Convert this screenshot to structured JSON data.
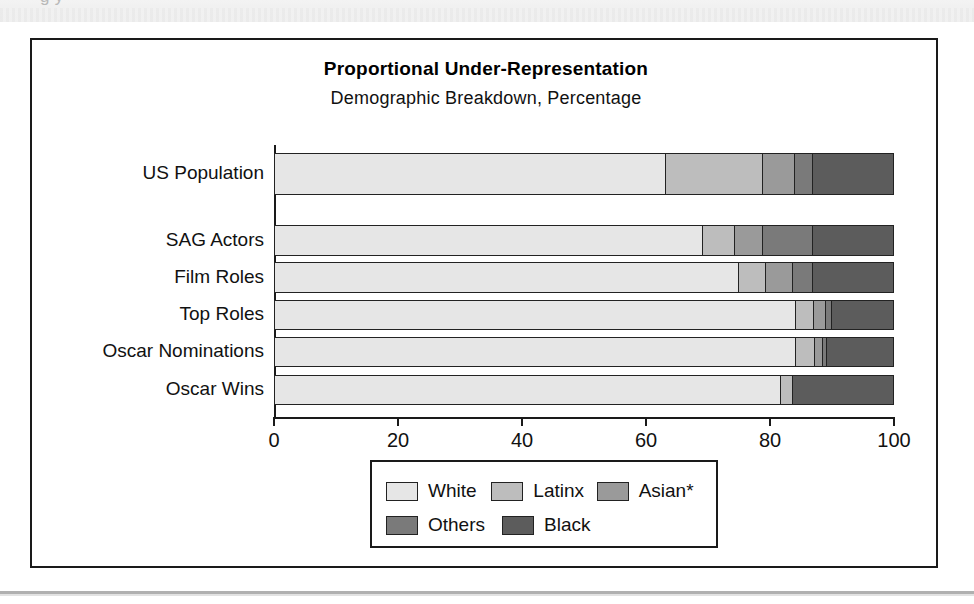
{
  "page": {
    "scan_artifact_text": "g                                      y",
    "figure_border_color": "#1a1a1a"
  },
  "chart_data": {
    "type": "bar",
    "orientation": "horizontal",
    "stacked": true,
    "stack_total": 100,
    "title": "Proportional Under-Representation",
    "subtitle": "Demographic Breakdown, Percentage",
    "xlabel": "",
    "ylabel": "",
    "xlim": [
      0,
      100
    ],
    "xticks": [
      0,
      20,
      40,
      60,
      80,
      100
    ],
    "xtick_labels": [
      "0",
      "20",
      "40",
      "60",
      "80",
      "100"
    ],
    "grid": false,
    "legend_position": "bottom-center",
    "categories": [
      "US Population",
      "SAG Actors",
      "Film Roles",
      "Top Roles",
      "Oscar Nominations",
      "Oscar Wins"
    ],
    "series": [
      {
        "name": "White",
        "color": "#e6e6e6",
        "values": [
          63.3,
          69.3,
          75.0,
          84.3,
          84.3,
          81.8
        ]
      },
      {
        "name": "Latinx",
        "color": "#bdbdbd",
        "values": [
          15.7,
          5.2,
          4.4,
          2.9,
          3.1,
          2.1
        ]
      },
      {
        "name": "Asian*",
        "color": "#9a9a9a",
        "values": [
          5.2,
          4.5,
          4.5,
          1.9,
          1.3,
          0.0
        ]
      },
      {
        "name": "Others",
        "color": "#7a7a7a",
        "values": [
          2.9,
          8.1,
          3.1,
          1.0,
          0.6,
          0.0
        ]
      },
      {
        "name": "Black",
        "color": "#5c5c5c",
        "values": [
          12.9,
          12.9,
          13.0,
          9.9,
          10.7,
          16.1
        ]
      }
    ],
    "footnote_marker": "*"
  },
  "legend": {
    "rows": [
      [
        {
          "label": "White",
          "color": "#e6e6e6"
        },
        {
          "label": "Latinx",
          "color": "#bdbdbd"
        },
        {
          "label": "Asian*",
          "color": "#9a9a9a"
        }
      ],
      [
        {
          "label": "Others",
          "color": "#7a7a7a"
        },
        {
          "label": "Black",
          "color": "#5c5c5c"
        }
      ]
    ]
  }
}
